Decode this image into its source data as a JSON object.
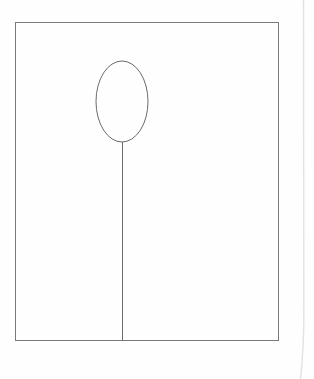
{
  "page": {
    "background_color": "#ffffff",
    "width": 314,
    "height": 379
  },
  "figure": {
    "title": "",
    "caption": "",
    "ink_color": "#7a7a7a",
    "ink_color_dark": "#6b6b6b",
    "artifact_color": "#e2e2e2",
    "line_width": 1,
    "shapes": [
      {
        "name": "frame-rectangle",
        "type": "rect",
        "x": 15,
        "y": 22,
        "width": 264,
        "height": 319,
        "stroke": "#7a7a7a",
        "fill": "none"
      },
      {
        "name": "balloon-ellipse",
        "type": "ellipse",
        "cx": 122,
        "cy": 101.5,
        "rx": 26,
        "ry": 40.5,
        "stroke": "#6b6b6b",
        "fill": "none"
      },
      {
        "name": "balloon-stem",
        "type": "line",
        "x1": 122,
        "y1": 142,
        "x2": 122,
        "y2": 341,
        "stroke": "#6b6b6b"
      },
      {
        "name": "page-edge-artifact",
        "type": "path",
        "d": "M 303.5 0 L 303.8 300 Q 304.4 345 300.5 379",
        "stroke": "#e2e2e2",
        "fill": "none"
      }
    ]
  }
}
